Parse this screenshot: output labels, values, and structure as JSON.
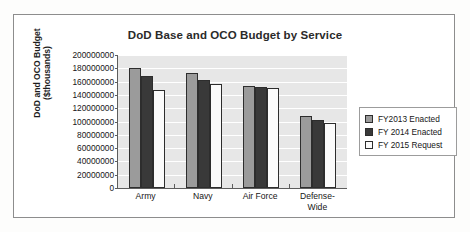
{
  "chart_data": {
    "type": "bar",
    "title": "DoD Base and OCO Budget by Service",
    "xlabel": "",
    "ylabel_lines": [
      "DoD and OCO Budget",
      "($thousands)"
    ],
    "ylabel": "DoD and OCO Budget ($thousands)",
    "categories": [
      "Army",
      "Navy",
      "Air Force",
      "Defense-Wide"
    ],
    "category_label_lines": [
      [
        "Army"
      ],
      [
        "Navy"
      ],
      [
        "Air Force"
      ],
      [
        "Defense-",
        "Wide"
      ]
    ],
    "series": [
      {
        "name": "FY2013 Enacted",
        "color": "#9b9b9b",
        "values": [
          181000000,
          173000000,
          154000000,
          109000000
        ]
      },
      {
        "name": "FY 2014 Enacted",
        "color": "#393939",
        "values": [
          168000000,
          162000000,
          152000000,
          102000000
        ]
      },
      {
        "name": "FY 2015 Request",
        "color": "#fbfbfb",
        "values": [
          147000000,
          156000000,
          151000000,
          97000000
        ]
      }
    ],
    "ylim": [
      0,
      200000000
    ],
    "ytick_step": 20000000,
    "ytick_labels": [
      "200000000",
      "180000000",
      "160000000",
      "140000000",
      "120000000",
      "100000000",
      "80000000",
      "60000000",
      "40000000",
      "20000000",
      "0"
    ],
    "grid": true,
    "legend_position": "right",
    "plot_background": "#e7e7e7",
    "gridline_color": "#ffffff",
    "axis_color": "#5d5d5d",
    "frame_color": "#8d8d8d"
  }
}
